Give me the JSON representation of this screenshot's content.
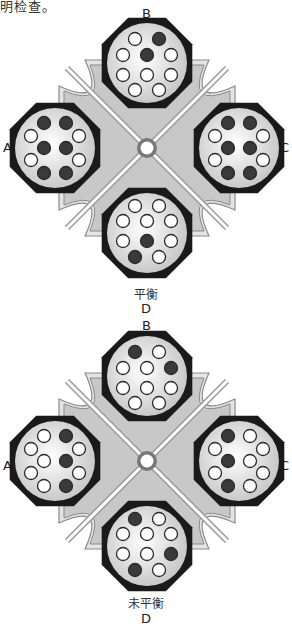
{
  "header_fragment": "明检查。",
  "colors": {
    "frame_fill": "#c8c8c8",
    "frame_outline": "#8a8a8a",
    "arm_line": "#ffffff",
    "rotor_rim": "#1a1a1a",
    "rotor_face": "#e6e6e6",
    "hole_empty": "#ffffff",
    "hole_filled": "#3a3a3a",
    "hub_ring": "#777777"
  },
  "diagrams": [
    {
      "id": "balanced",
      "state_label": "平衡",
      "positions": {
        "top": "B",
        "left": "A",
        "right": "C",
        "bottom": "D"
      },
      "rotors": {
        "B": {
          "holes": [
            {
              "x": -12,
              "y": -24,
              "f": false
            },
            {
              "x": 12,
              "y": -24,
              "f": true
            },
            {
              "x": -24,
              "y": -8,
              "f": false
            },
            {
              "x": 0,
              "y": -8,
              "f": true
            },
            {
              "x": 24,
              "y": -8,
              "f": false
            },
            {
              "x": -24,
              "y": 12,
              "f": false
            },
            {
              "x": 0,
              "y": 12,
              "f": false
            },
            {
              "x": 24,
              "y": 12,
              "f": false
            },
            {
              "x": -12,
              "y": 27,
              "f": false
            },
            {
              "x": 12,
              "y": 27,
              "f": false
            }
          ]
        },
        "A": {
          "holes": [
            {
              "x": -11,
              "y": -25,
              "f": true
            },
            {
              "x": 11,
              "y": -25,
              "f": true
            },
            {
              "x": -24,
              "y": -12,
              "f": false
            },
            {
              "x": 24,
              "y": -12,
              "f": false
            },
            {
              "x": -11,
              "y": 0,
              "f": true
            },
            {
              "x": 11,
              "y": 0,
              "f": true
            },
            {
              "x": -24,
              "y": 12,
              "f": false
            },
            {
              "x": 24,
              "y": 12,
              "f": false
            },
            {
              "x": -11,
              "y": 25,
              "f": true
            },
            {
              "x": 11,
              "y": 25,
              "f": true
            }
          ]
        },
        "C": {
          "holes": [
            {
              "x": -11,
              "y": -25,
              "f": true
            },
            {
              "x": 11,
              "y": -25,
              "f": true
            },
            {
              "x": -24,
              "y": -12,
              "f": false
            },
            {
              "x": 24,
              "y": -12,
              "f": false
            },
            {
              "x": -11,
              "y": 0,
              "f": true
            },
            {
              "x": 11,
              "y": 0,
              "f": true
            },
            {
              "x": -24,
              "y": 12,
              "f": false
            },
            {
              "x": 24,
              "y": 12,
              "f": false
            },
            {
              "x": -11,
              "y": 25,
              "f": true
            },
            {
              "x": 11,
              "y": 25,
              "f": true
            }
          ]
        },
        "D": {
          "holes": [
            {
              "x": -12,
              "y": -27,
              "f": false
            },
            {
              "x": 12,
              "y": -27,
              "f": false
            },
            {
              "x": -24,
              "y": -12,
              "f": false
            },
            {
              "x": 0,
              "y": -12,
              "f": false
            },
            {
              "x": 24,
              "y": -12,
              "f": false
            },
            {
              "x": -24,
              "y": 8,
              "f": false
            },
            {
              "x": 0,
              "y": 8,
              "f": true
            },
            {
              "x": 24,
              "y": 8,
              "f": false
            },
            {
              "x": -12,
              "y": 24,
              "f": true
            },
            {
              "x": 12,
              "y": 24,
              "f": false
            }
          ]
        }
      }
    },
    {
      "id": "unbalanced",
      "state_label": "未平衡",
      "positions": {
        "top": "B",
        "left": "A",
        "right": "C",
        "bottom": "D"
      },
      "rotors": {
        "B": {
          "holes": [
            {
              "x": -12,
              "y": -24,
              "f": true
            },
            {
              "x": 12,
              "y": -24,
              "f": false
            },
            {
              "x": -24,
              "y": -8,
              "f": false
            },
            {
              "x": 0,
              "y": -8,
              "f": false
            },
            {
              "x": 24,
              "y": -8,
              "f": true
            },
            {
              "x": -24,
              "y": 12,
              "f": false
            },
            {
              "x": 0,
              "y": 12,
              "f": false
            },
            {
              "x": 24,
              "y": 12,
              "f": false
            },
            {
              "x": -12,
              "y": 27,
              "f": false
            },
            {
              "x": 12,
              "y": 27,
              "f": false
            }
          ]
        },
        "A": {
          "holes": [
            {
              "x": -11,
              "y": -25,
              "f": false
            },
            {
              "x": 11,
              "y": -25,
              "f": true
            },
            {
              "x": -24,
              "y": -12,
              "f": false
            },
            {
              "x": 24,
              "y": -12,
              "f": false
            },
            {
              "x": -11,
              "y": 0,
              "f": false
            },
            {
              "x": 11,
              "y": 0,
              "f": true
            },
            {
              "x": -24,
              "y": 12,
              "f": false
            },
            {
              "x": 24,
              "y": 12,
              "f": false
            },
            {
              "x": -11,
              "y": 25,
              "f": false
            },
            {
              "x": 11,
              "y": 25,
              "f": true
            }
          ]
        },
        "C": {
          "holes": [
            {
              "x": -11,
              "y": -25,
              "f": true
            },
            {
              "x": 11,
              "y": -25,
              "f": false
            },
            {
              "x": -24,
              "y": -12,
              "f": false
            },
            {
              "x": 24,
              "y": -12,
              "f": false
            },
            {
              "x": -11,
              "y": 0,
              "f": true
            },
            {
              "x": 11,
              "y": 0,
              "f": false
            },
            {
              "x": -24,
              "y": 12,
              "f": false
            },
            {
              "x": 24,
              "y": 12,
              "f": false
            },
            {
              "x": -11,
              "y": 25,
              "f": true
            },
            {
              "x": 11,
              "y": 25,
              "f": false
            }
          ]
        },
        "D": {
          "holes": [
            {
              "x": -12,
              "y": -27,
              "f": true
            },
            {
              "x": 12,
              "y": -27,
              "f": false
            },
            {
              "x": -24,
              "y": -12,
              "f": false
            },
            {
              "x": 0,
              "y": -12,
              "f": false
            },
            {
              "x": 24,
              "y": -12,
              "f": false
            },
            {
              "x": -24,
              "y": 8,
              "f": false
            },
            {
              "x": 0,
              "y": 8,
              "f": false
            },
            {
              "x": 24,
              "y": 8,
              "f": true
            },
            {
              "x": -12,
              "y": 24,
              "f": true
            },
            {
              "x": 12,
              "y": 24,
              "f": false
            }
          ]
        }
      }
    }
  ]
}
